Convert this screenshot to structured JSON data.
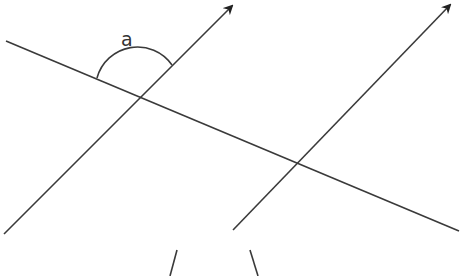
{
  "diagram": {
    "type": "parallel-lines-cut-by-transversal",
    "stroke_color": "#3a3a3a",
    "angle_label": "a",
    "lines": [
      {
        "name": "transversal",
        "x1": 6,
        "y1": 41,
        "x2": 459,
        "y2": 231,
        "arrow": false
      },
      {
        "name": "parallel-line-1",
        "x1": 4,
        "y1": 234,
        "x2": 235,
        "y2": 3,
        "arrow": true
      },
      {
        "name": "parallel-line-2",
        "x1": 233,
        "y1": 230,
        "x2": 452,
        "y2": 2,
        "arrow": true
      },
      {
        "name": "partial-line-left",
        "x1": 177,
        "y1": 250,
        "x2": 170,
        "y2": 276,
        "arrow": false
      },
      {
        "name": "partial-line-right",
        "x1": 250,
        "y1": 250,
        "x2": 258,
        "y2": 276,
        "arrow": false
      }
    ],
    "angle_arc": {
      "cx": 138,
      "cy": 96,
      "r": 42
    }
  }
}
